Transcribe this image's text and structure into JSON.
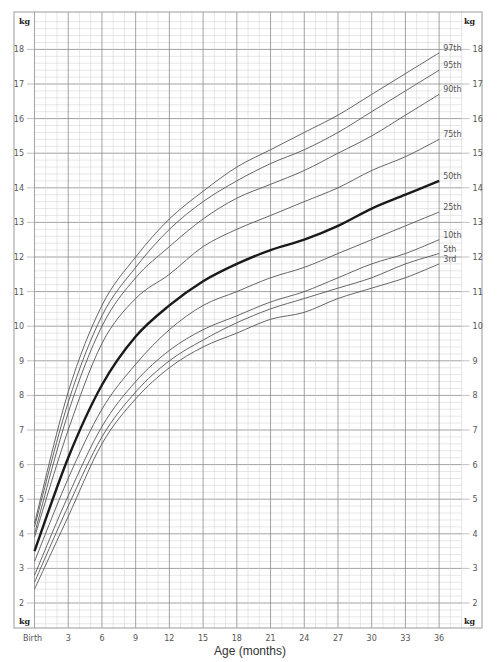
{
  "chart_data": {
    "type": "line",
    "title": "",
    "xlabel": "Age (months)",
    "ylabel": "kg",
    "unit_label": "kg",
    "x_ticks": [
      "Birth",
      "3",
      "6",
      "9",
      "12",
      "15",
      "18",
      "21",
      "24",
      "27",
      "30",
      "33",
      "36"
    ],
    "y_ticks": [
      2,
      3,
      4,
      5,
      6,
      7,
      8,
      9,
      10,
      11,
      12,
      13,
      14,
      15,
      16,
      17,
      18
    ],
    "xlim": [
      0,
      38
    ],
    "ylim": [
      1.3,
      18.9
    ],
    "grid": true,
    "x": [
      0,
      3,
      6,
      9,
      12,
      15,
      18,
      21,
      24,
      27,
      30,
      33,
      36
    ],
    "series": [
      {
        "name": "97th",
        "bold": false,
        "values": [
          4.3,
          8.1,
          10.6,
          12.0,
          13.1,
          13.9,
          14.6,
          15.1,
          15.6,
          16.1,
          16.7,
          17.3,
          17.9
        ]
      },
      {
        "name": "95th",
        "bold": false,
        "values": [
          4.2,
          7.8,
          10.3,
          11.7,
          12.8,
          13.6,
          14.2,
          14.7,
          15.1,
          15.6,
          16.2,
          16.8,
          17.4
        ]
      },
      {
        "name": "90th",
        "bold": false,
        "values": [
          4.0,
          7.5,
          10.0,
          11.4,
          12.3,
          13.1,
          13.7,
          14.1,
          14.5,
          15.0,
          15.5,
          16.1,
          16.7
        ]
      },
      {
        "name": "75th",
        "bold": false,
        "values": [
          3.9,
          7.0,
          9.5,
          10.8,
          11.5,
          12.3,
          12.8,
          13.2,
          13.6,
          14.0,
          14.5,
          14.9,
          15.4
        ]
      },
      {
        "name": "50th",
        "bold": true,
        "values": [
          3.5,
          6.2,
          8.3,
          9.7,
          10.6,
          11.3,
          11.8,
          12.2,
          12.5,
          12.9,
          13.4,
          13.8,
          14.2
        ]
      },
      {
        "name": "25th",
        "bold": false,
        "values": [
          3.2,
          5.6,
          7.6,
          8.9,
          9.9,
          10.6,
          11.0,
          11.4,
          11.7,
          12.1,
          12.5,
          12.9,
          13.3
        ]
      },
      {
        "name": "10th",
        "bold": false,
        "values": [
          2.8,
          5.1,
          7.1,
          8.4,
          9.3,
          9.9,
          10.3,
          10.7,
          11.0,
          11.4,
          11.8,
          12.1,
          12.5
        ]
      },
      {
        "name": "5th",
        "bold": false,
        "values": [
          2.6,
          4.8,
          6.8,
          8.1,
          9.0,
          9.6,
          10.1,
          10.5,
          10.8,
          11.1,
          11.4,
          11.8,
          12.1
        ]
      },
      {
        "name": "3rd",
        "bold": false,
        "values": [
          2.4,
          4.5,
          6.6,
          7.9,
          8.8,
          9.4,
          9.8,
          10.2,
          10.4,
          10.8,
          11.1,
          11.4,
          11.8
        ]
      }
    ]
  },
  "colors": {
    "frame": "#9a9a9a",
    "grid_major": "#8c8c8c",
    "grid_minor": "#cfcfcf",
    "curve": "#555555",
    "curve_bold": "#1a1a1a"
  }
}
